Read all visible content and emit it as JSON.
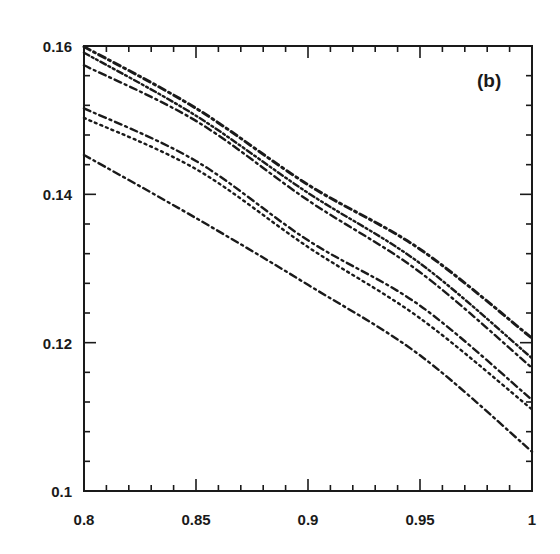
{
  "chart_data": {
    "type": "line",
    "title": "",
    "panel_label": "(b)",
    "xlabel": "",
    "ylabel": "",
    "xlim": [
      0.8,
      1.0
    ],
    "ylim": [
      0.1,
      0.16
    ],
    "grid": false,
    "legend": null,
    "x_ticks": {
      "major": [
        0.8,
        0.85,
        0.9,
        0.95,
        1.0
      ],
      "major_labels": [
        "0.8",
        "0.85",
        "0.9",
        "0.95",
        "1"
      ],
      "minor_step": 0.01
    },
    "y_ticks": {
      "major": [
        0.1,
        0.12,
        0.14,
        0.16
      ],
      "major_labels": [
        "0.1",
        "0.12",
        "0.14",
        "0.16"
      ],
      "minor_step": 0.004
    },
    "x": [
      0.8,
      0.85,
      0.9,
      0.95,
      1.0
    ],
    "series": [
      {
        "name": "curve 1",
        "style": "dash-dot",
        "values": [
          0.1599,
          0.1516,
          0.1413,
          0.1326,
          0.1206
        ]
      },
      {
        "name": "curve 2",
        "style": "dash-dot-dot",
        "values": [
          0.1591,
          0.1506,
          0.1402,
          0.1307,
          0.1179
        ]
      },
      {
        "name": "curve 3",
        "style": "dash-dot",
        "values": [
          0.1574,
          0.1499,
          0.1392,
          0.1295,
          0.1166
        ]
      },
      {
        "name": "curve 4",
        "style": "dash-dot",
        "values": [
          0.1516,
          0.1445,
          0.1338,
          0.125,
          0.1123
        ]
      },
      {
        "name": "curve 5",
        "style": "dotted",
        "values": [
          0.1503,
          0.1434,
          0.1329,
          0.1233,
          0.111
        ]
      },
      {
        "name": "curve 6",
        "style": "dash-dot",
        "values": [
          0.1453,
          0.1368,
          0.1278,
          0.1183,
          0.1053
        ]
      }
    ]
  },
  "colors": {
    "ink": "#1a1a1a",
    "background": "#ffffff"
  }
}
